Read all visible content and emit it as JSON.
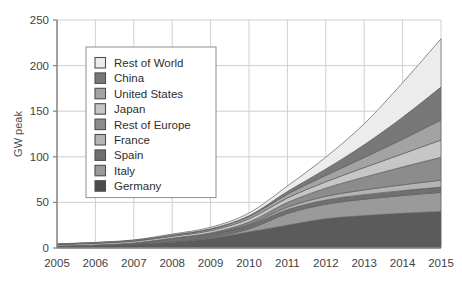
{
  "chart_data": {
    "type": "area",
    "stacked": true,
    "title": "",
    "xlabel": "",
    "ylabel": "GW peak",
    "x": [
      2005,
      2006,
      2007,
      2008,
      2009,
      2010,
      2011,
      2012,
      2013,
      2014,
      2015
    ],
    "xticklabels": [
      "2005",
      "2006",
      "2007",
      "2008",
      "2009",
      "2010",
      "2011",
      "2012",
      "2013",
      "2014",
      "2015"
    ],
    "yticklabels": [
      "0",
      "50",
      "100",
      "150",
      "200",
      "250"
    ],
    "yticks": [
      0,
      50,
      100,
      150,
      200,
      250
    ],
    "ylim": [
      0,
      250
    ],
    "xlim": [
      2005,
      2015
    ],
    "grid": true,
    "legend_position": "upper-left-inside",
    "stack_order_bottom_to_top": [
      "Germany",
      "Italy",
      "Spain",
      "France",
      "Rest of Europe",
      "Japan",
      "United States",
      "China",
      "Rest of World"
    ],
    "series": [
      {
        "name": "Germany",
        "color": "#5b5b5b",
        "values": [
          2.0,
          2.9,
          4.2,
          6.1,
          10.5,
          17.5,
          25.0,
          32.0,
          35.5,
          38.0,
          40.0
        ]
      },
      {
        "name": "Italy",
        "color": "#9a9a9a",
        "values": [
          0.1,
          0.1,
          0.2,
          0.5,
          1.2,
          3.5,
          12.8,
          16.0,
          18.0,
          19.5,
          21.0
        ]
      },
      {
        "name": "Spain",
        "color": "#707070",
        "values": [
          0.1,
          0.2,
          0.7,
          3.4,
          3.5,
          3.9,
          4.3,
          4.6,
          5.0,
          5.4,
          5.8
        ]
      },
      {
        "name": "France",
        "color": "#b4b4b4",
        "values": [
          0.0,
          0.0,
          0.1,
          0.2,
          0.3,
          1.0,
          2.8,
          4.0,
          5.2,
          6.4,
          7.6
        ]
      },
      {
        "name": "Rest of Europe",
        "color": "#8c8c8c",
        "values": [
          0.1,
          0.2,
          0.3,
          0.6,
          1.0,
          2.5,
          5.0,
          9.0,
          14.0,
          19.5,
          25.0
        ]
      },
      {
        "name": "Japan",
        "color": "#c6c6c6",
        "values": [
          1.4,
          1.7,
          1.9,
          2.1,
          2.6,
          3.6,
          4.9,
          7.0,
          10.5,
          14.5,
          19.0
        ]
      },
      {
        "name": "United States",
        "color": "#a3a3a3",
        "values": [
          0.5,
          0.6,
          0.8,
          1.2,
          1.6,
          2.5,
          4.2,
          7.0,
          11.0,
          16.0,
          22.0
        ]
      },
      {
        "name": "China",
        "color": "#787878",
        "values": [
          0.1,
          0.1,
          0.1,
          0.2,
          0.4,
          0.9,
          3.0,
          7.0,
          14.0,
          24.0,
          36.0
        ]
      },
      {
        "name": "Rest of World",
        "color": "#ececec",
        "values": [
          0.3,
          0.4,
          0.6,
          1.0,
          1.6,
          3.0,
          6.0,
          13.0,
          23.0,
          38.0,
          53.0
        ]
      }
    ],
    "legend_entries": [
      {
        "label": "Rest of World",
        "color": "#ececec"
      },
      {
        "label": "China",
        "color": "#787878"
      },
      {
        "label": "United States",
        "color": "#a3a3a3"
      },
      {
        "label": "Japan",
        "color": "#c6c6c6"
      },
      {
        "label": "Rest of Europe",
        "color": "#8c8c8c"
      },
      {
        "label": "France",
        "color": "#b4b4b4"
      },
      {
        "label": "Spain",
        "color": "#707070"
      },
      {
        "label": "Italy",
        "color": "#9a9a9a"
      },
      {
        "label": "Germany",
        "color": "#4a4a4a"
      }
    ]
  },
  "page": {
    "top_cut_text": "",
    "bottom_cut_text": ""
  },
  "style": {
    "grid_color": "#d0d0d0",
    "axis_color": "#8a8a8a",
    "band_stroke": "#5e5e5e",
    "legend_border": "#8e8e8e"
  }
}
